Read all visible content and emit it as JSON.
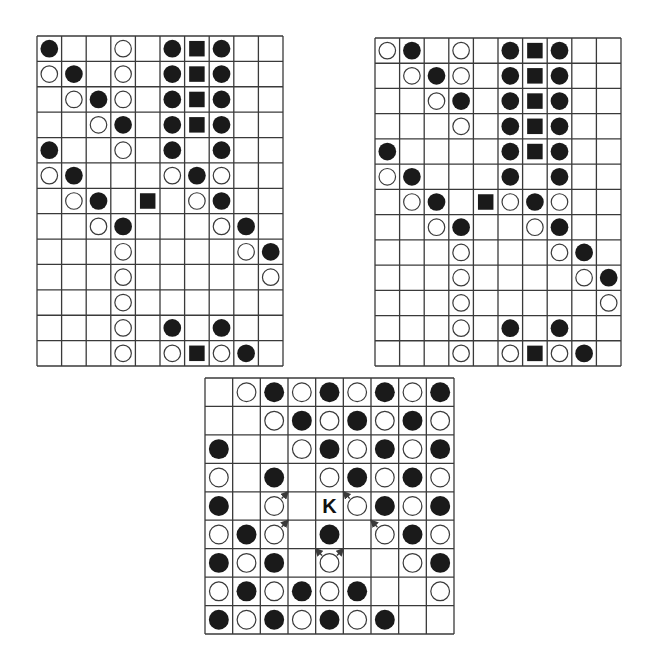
{
  "legend": {
    "B": "black-stone",
    "W": "white-stone",
    "S": "black-square-marker",
    "K": "label-k",
    ".": "empty"
  },
  "boards": [
    {
      "id": "board-1",
      "rows": 13,
      "cols": 10,
      "cells": [
        "B..W.BSB..",
        "WB.W.BSB..",
        ".WBW.BSB..",
        "..WB.BSB..",
        "B..W.B.B..",
        "WB...WBW..",
        ".WB.S.WB..",
        "..WB...WB.",
        "...W....WB",
        "...W.....W",
        "...W......",
        "...W.B.B..",
        "...W.WSWB."
      ],
      "arrows": []
    },
    {
      "id": "board-2",
      "rows": 13,
      "cols": 10,
      "cells": [
        "WB.W.BSB..",
        ".WBW.BSB..",
        "..WB.BSB..",
        "...W.BSB..",
        "B....BSB..",
        "WB...B.B..",
        ".WB.SWBW..",
        "..WB..WB..",
        "...W...WB.",
        "...W....WB",
        "...W.....W",
        "...W.B.B..",
        "...W.WSWB."
      ],
      "arrows": []
    },
    {
      "id": "board-3",
      "rows": 9,
      "cols": 9,
      "cells": [
        ".WBWBWBWB",
        "..WBWBWBW",
        "B..WBWBWB",
        "W.B.WBWBW",
        "B.W.KWBWB",
        "WBW.B.WBW",
        "BWB.W..WB",
        "WBWBWB..W",
        "BWBWBWB.."
      ],
      "arrows": [
        {
          "from": [
            4,
            2
          ],
          "dir": "up-right"
        },
        {
          "from": [
            5,
            2
          ],
          "dir": "up-right"
        },
        {
          "from": [
            4,
            5
          ],
          "dir": "up-left"
        },
        {
          "from": [
            5,
            6
          ],
          "dir": "up-left"
        },
        {
          "from": [
            6,
            4
          ],
          "dir": "up-left"
        },
        {
          "from": [
            6,
            4
          ],
          "dir": "up-right"
        }
      ]
    }
  ],
  "colors": {
    "line": "#3a3a3a",
    "black_stone": "#1a1a1a",
    "white_stone_fill": "#ffffff",
    "white_stone_stroke": "#3a3a3a",
    "label": "#111111"
  }
}
